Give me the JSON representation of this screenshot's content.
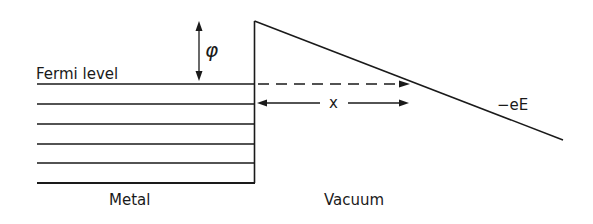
{
  "diagram": {
    "labels": {
      "fermi_level": "Fermi level",
      "work_function": "φ",
      "distance": "x",
      "field": "−eE",
      "metal": "Metal",
      "vacuum": "Vacuum"
    },
    "colors": {
      "stroke": "#1a1a1a",
      "background": "#ffffff"
    },
    "metal_levels_count": 6
  }
}
